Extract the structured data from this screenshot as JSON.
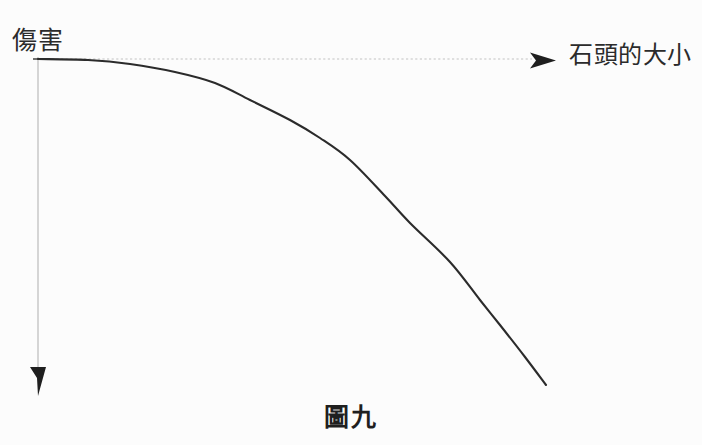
{
  "figure": {
    "caption": "圖九",
    "y_axis_label": "傷害",
    "x_axis_label": "石頭的大小",
    "background_color": "#fcfcfc",
    "curve_color": "#2b2b2b",
    "axis_color": "#c9c9c9",
    "arrow_color": "#1f1f1f",
    "text_color": "#2b2b2b"
  },
  "chart_data": {
    "type": "line",
    "title": "圖九",
    "xlabel": "石頭的大小",
    "ylabel": "傷害",
    "grid": false,
    "legend": null,
    "axis_style": {
      "x_axis": "dotted-gray-with-right-arrow",
      "y_axis": "solid-gray-with-down-arrow",
      "y_direction": "downward-increasing",
      "ticks": "none",
      "tick_labels": "none"
    },
    "x": [
      0,
      0.1,
      0.2,
      0.3,
      0.4,
      0.5,
      0.6,
      0.7,
      0.8,
      0.9,
      1.0
    ],
    "y": [
      1.0,
      0.99,
      0.96,
      0.91,
      0.84,
      0.74,
      0.63,
      0.5,
      0.36,
      0.2,
      0.0
    ],
    "xlim": [
      0,
      1
    ],
    "ylim": [
      0,
      1
    ],
    "points_px": [
      [
        38,
        59
      ],
      [
        88,
        60
      ],
      [
        130,
        64
      ],
      [
        175,
        72
      ],
      [
        215,
        83
      ],
      [
        250,
        100
      ],
      [
        290,
        120
      ],
      [
        320,
        138
      ],
      [
        350,
        160
      ],
      [
        385,
        196
      ],
      [
        410,
        223
      ],
      [
        450,
        262
      ],
      [
        480,
        300
      ],
      [
        500,
        325
      ],
      [
        525,
        357
      ],
      [
        546,
        385
      ]
    ]
  }
}
